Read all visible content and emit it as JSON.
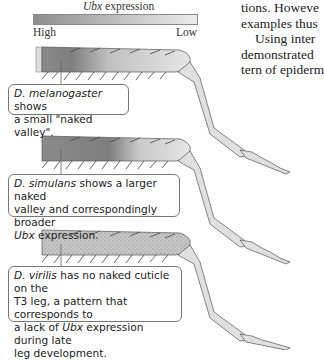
{
  "legend": {
    "title_italic": "Ubx",
    "title_rest": " expression",
    "high_label": "High",
    "low_label": "Low",
    "gradient_colors": [
      "#8e8e8e",
      "#ececec"
    ]
  },
  "body_text": {
    "lines": [
      "tions. Howeve",
      "examples thus",
      "  Using inter",
      "demonstrated",
      "tern of epiderm"
    ]
  },
  "callouts": [
    {
      "species_italic": "D. melanogaster",
      "text_parts": [
        " shows",
        "a small \"naked valley\"."
      ]
    },
    {
      "species_italic": "D. simulans",
      "text_parts": [
        " shows a larger naked",
        "valley and correspondingly broader",
        "Ubx",
        " expression."
      ]
    },
    {
      "species_italic": "D. virilis",
      "text_parts": [
        " has no naked cuticle on the",
        "T3 leg, a pattern that corresponds to",
        "a lack of ",
        "Ubx",
        " expression during late",
        "leg development."
      ]
    }
  ],
  "colors": {
    "leg_fill": "#e0e0e0",
    "leg_stroke": "#555555",
    "callout_border": "#777777"
  }
}
